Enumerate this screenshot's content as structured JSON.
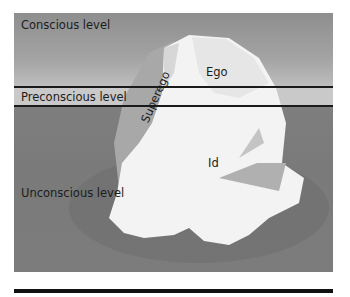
{
  "diagram": {
    "type": "iceberg-model-of-mind",
    "levels": [
      {
        "id": "conscious",
        "label": "Conscious level"
      },
      {
        "id": "preconscious",
        "label": "Preconscious level"
      },
      {
        "id": "unconscious",
        "label": "Unconscious level"
      }
    ],
    "structures": [
      {
        "id": "ego",
        "label": "Ego"
      },
      {
        "id": "superego",
        "label": "Superego"
      },
      {
        "id": "id",
        "label": "Id"
      }
    ],
    "colors": {
      "water_dark": "#7a7a7a",
      "sky": "#a4a4a4",
      "band": "#c9c9c9",
      "ice": "#f4f4f4",
      "lines": "#1a1a1a"
    }
  }
}
